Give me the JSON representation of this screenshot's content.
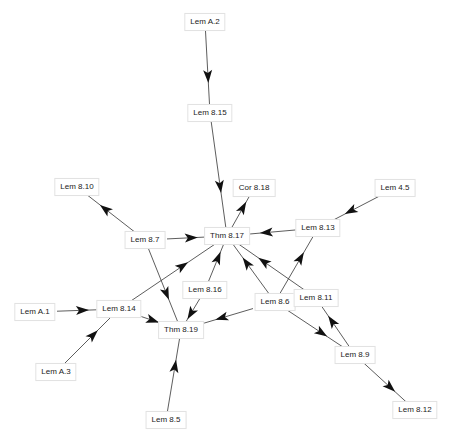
{
  "diagram": {
    "type": "dependency-graph",
    "colors": {
      "edge": "#333333",
      "arrow": "#111111",
      "node_border": "#e2e2e2",
      "node_text": "#222222"
    },
    "nodes": [
      {
        "id": "lemA2",
        "label": "Lem A.2",
        "x": 205,
        "y": 22
      },
      {
        "id": "lem815",
        "label": "Lem 8.15",
        "x": 210,
        "y": 113
      },
      {
        "id": "cor818",
        "label": "Cor 8.18",
        "x": 254,
        "y": 188
      },
      {
        "id": "lem810",
        "label": "Lem 8.10",
        "x": 77,
        "y": 187
      },
      {
        "id": "lem45",
        "label": "Lem 4.5",
        "x": 395,
        "y": 188
      },
      {
        "id": "lem87",
        "label": "Lem 8.7",
        "x": 145,
        "y": 240
      },
      {
        "id": "thm817",
        "label": "Thm 8.17",
        "x": 227,
        "y": 236
      },
      {
        "id": "lem813",
        "label": "Lem 8.13",
        "x": 318,
        "y": 228
      },
      {
        "id": "lem816",
        "label": "Lem 8.16",
        "x": 205,
        "y": 290
      },
      {
        "id": "lem86",
        "label": "Lem 8.6",
        "x": 275,
        "y": 302
      },
      {
        "id": "lem811",
        "label": "Lem 8.11",
        "x": 316,
        "y": 298
      },
      {
        "id": "lemA1",
        "label": "Lem A.1",
        "x": 35,
        "y": 312
      },
      {
        "id": "lem814",
        "label": "Lem 8.14",
        "x": 119,
        "y": 309
      },
      {
        "id": "thm819",
        "label": "Thm 8.19",
        "x": 181,
        "y": 330
      },
      {
        "id": "lemA3",
        "label": "Lem A.3",
        "x": 56,
        "y": 372
      },
      {
        "id": "lem89",
        "label": "Lem 8.9",
        "x": 355,
        "y": 355
      },
      {
        "id": "lem85",
        "label": "Lem 8.5",
        "x": 166,
        "y": 420
      },
      {
        "id": "lem812",
        "label": "Lem 8.12",
        "x": 415,
        "y": 410
      }
    ],
    "edges": [
      {
        "from": "lemA2",
        "to": "lem815"
      },
      {
        "from": "lem815",
        "to": "thm817"
      },
      {
        "from": "thm817",
        "to": "cor818"
      },
      {
        "from": "lem87",
        "to": "lem810"
      },
      {
        "from": "lem87",
        "to": "thm817"
      },
      {
        "from": "lem87",
        "to": "thm819"
      },
      {
        "from": "lem45",
        "to": "lem813"
      },
      {
        "from": "lem813",
        "to": "thm817"
      },
      {
        "from": "lem814",
        "to": "thm817"
      },
      {
        "from": "lem816",
        "to": "thm817"
      },
      {
        "from": "lem816",
        "to": "thm819"
      },
      {
        "from": "lem86",
        "to": "thm817"
      },
      {
        "from": "lem811",
        "to": "thm817"
      },
      {
        "from": "lem86",
        "to": "lem813"
      },
      {
        "from": "lem86",
        "to": "thm819"
      },
      {
        "from": "lem86",
        "to": "lem89"
      },
      {
        "from": "lem89",
        "to": "lem811"
      },
      {
        "from": "lem89",
        "to": "lem812"
      },
      {
        "from": "lemA1",
        "to": "lem814"
      },
      {
        "from": "lemA3",
        "to": "lem814"
      },
      {
        "from": "lem814",
        "to": "thm819"
      },
      {
        "from": "lem85",
        "to": "thm819"
      }
    ]
  }
}
